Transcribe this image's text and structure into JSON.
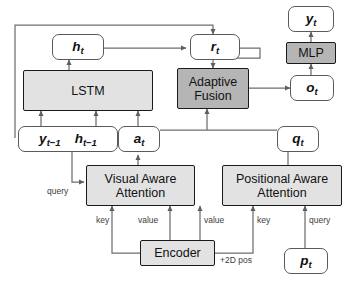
{
  "figure": {
    "type": "architecture-diagram",
    "palette": {
      "light_box_fill": "#e2e2e2",
      "dark_box_fill": "#b5b5b5",
      "box_stroke": "#1a1a1a",
      "var_stroke": "#5a5a5a",
      "wire": "#6e6e6e",
      "background": "#ffffff"
    }
  },
  "nodes": {
    "h_t": {
      "label": "h",
      "sub": "t"
    },
    "r_t": {
      "label": "r",
      "sub": "t"
    },
    "y_t": {
      "label": "y",
      "sub": "t"
    },
    "o_t": {
      "label": "o",
      "sub": "t"
    },
    "a_t": {
      "label": "a",
      "sub": "t"
    },
    "q_t": {
      "label": "q",
      "sub": "t"
    },
    "p_t": {
      "label": "p",
      "sub": "t"
    },
    "y_prev": {
      "label": "y",
      "sub": "t−1"
    },
    "h_prev": {
      "label": "h",
      "sub": "t−1"
    },
    "lstm": {
      "label": "LSTM"
    },
    "mlp": {
      "label": "MLP"
    },
    "adaptive_fusion": {
      "line1": "Adaptive",
      "line2": "Fusion"
    },
    "visual_attention": {
      "line1": "Visual Aware",
      "line2": "Attention"
    },
    "positional_attention": {
      "line1": "Positional Aware",
      "line2": "Attention"
    },
    "encoder": {
      "label": "Encoder"
    }
  },
  "edge_labels": {
    "visual_query": "query",
    "visual_key": "key",
    "visual_value": "value",
    "positional_value": "value",
    "positional_key": "key",
    "positional_query": "query",
    "two_d_pos": "+2D pos"
  }
}
